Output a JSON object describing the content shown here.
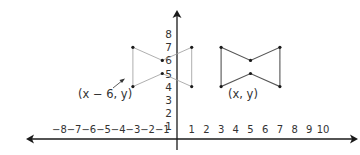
{
  "diagram": {
    "title": "",
    "x_axis": {
      "ticks": [
        -8,
        -7,
        -6,
        -5,
        -4,
        -3,
        -2,
        -1,
        1,
        2,
        3,
        4,
        5,
        6,
        7,
        8,
        9,
        10
      ],
      "tick_labels": [
        "−8",
        "−7",
        "−6",
        "−5",
        "−4",
        "−3",
        "−2",
        "−1",
        "1",
        "2",
        "3",
        "4",
        "5",
        "6",
        "7",
        "8",
        "9",
        "10"
      ]
    },
    "y_axis": {
      "ticks": [
        1,
        2,
        3,
        4,
        5,
        6,
        7,
        8
      ],
      "tick_labels": [
        "1",
        "2",
        "3",
        "4",
        "5",
        "6",
        "7",
        "8"
      ]
    },
    "original_shape": {
      "label": "(x, y)",
      "style": "solid",
      "vertices": [
        [
          3,
          7
        ],
        [
          5,
          6
        ],
        [
          7,
          7
        ],
        [
          7,
          4
        ],
        [
          5,
          5
        ],
        [
          3,
          4
        ]
      ]
    },
    "translated_shape": {
      "label": "(x − 6, y)",
      "style": "light",
      "vertices": [
        [
          -3,
          7
        ],
        [
          -1,
          6
        ],
        [
          1,
          7
        ],
        [
          1,
          4
        ],
        [
          -1,
          5
        ],
        [
          -3,
          4
        ]
      ]
    },
    "colors": {
      "axis": "#1a1a1a",
      "shape_solid": "#555555",
      "shape_light": "#9a9a9a",
      "point": "#1a1a1a",
      "text": "#333333"
    }
  }
}
